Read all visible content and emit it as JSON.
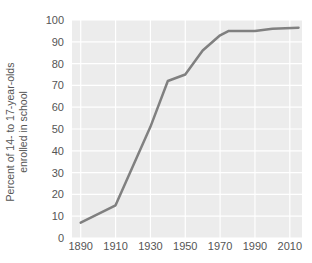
{
  "chart_data": {
    "type": "line",
    "title": "",
    "subtitle": "",
    "xlabel": "",
    "ylabel": "Percent of 14- to 17-year-olds enrolled in school",
    "ylabel_line1": "Percent of 14- to 17-year-olds",
    "ylabel_line2": "enrolled in school",
    "xlim": [
      1885,
      2017
    ],
    "ylim": [
      0,
      100
    ],
    "yticks": [
      0,
      10,
      20,
      30,
      40,
      50,
      60,
      70,
      80,
      90,
      100
    ],
    "ytick_labels": [
      "0",
      "10",
      "20",
      "30",
      "40",
      "50",
      "60",
      "70",
      "80",
      "90",
      "100"
    ],
    "xticks": [
      1890,
      1910,
      1930,
      1950,
      1970,
      1990,
      2010
    ],
    "xtick_labels": [
      "1890",
      "1910",
      "1930",
      "1950",
      "1970",
      "1990",
      "2010"
    ],
    "grid": true,
    "grid_color": "#ffffff",
    "plot_background": "#ececec",
    "figure_background": "#ffffff",
    "legend": null,
    "legend_position": "none",
    "series": [
      {
        "name": "Percent enrolled",
        "color": "#808080",
        "line_width": 2.5,
        "marker": "none",
        "x": [
          1890,
          1910,
          1930,
          1940,
          1950,
          1960,
          1970,
          1975,
          1990,
          2000,
          2015
        ],
        "values": [
          7,
          15,
          51,
          72,
          75,
          86,
          93,
          95,
          95,
          96,
          96.5
        ]
      }
    ]
  },
  "axis": {
    "tick_label_color": "#555555",
    "axis_label_color": "#555555"
  }
}
